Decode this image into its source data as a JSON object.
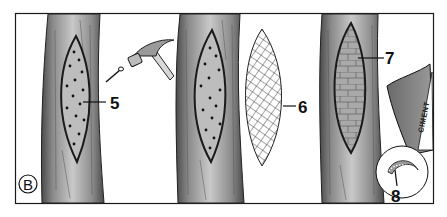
{
  "figure": {
    "panel_letter": "B",
    "labels": {
      "filler": "5",
      "mesh": "6",
      "bricks": "7",
      "trowel": "8"
    },
    "bag_text": "CIMENT",
    "colors": {
      "frame": "#1a1a1a",
      "bark_dark": "#5a5a5a",
      "bark_mid": "#9a9a9a",
      "bark_light": "#c8c8c8",
      "cavity_fill": "#b0b0b0",
      "brick": "#a8a8a8",
      "bag": "#7a7a7a"
    }
  }
}
